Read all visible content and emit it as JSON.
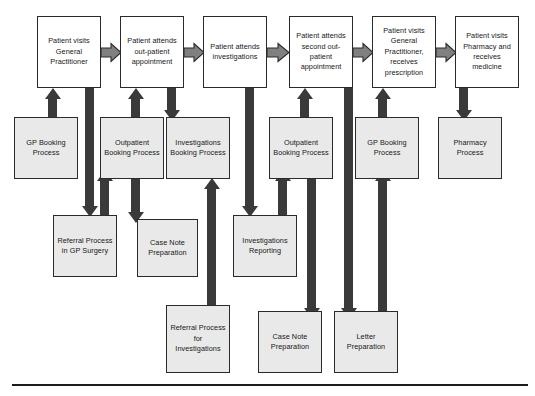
{
  "diagram": {
    "colors": {
      "patient_step_fill": "#ffffff",
      "process_fill": "#e9e9e9",
      "border": "#2b2b2b",
      "connector": "#3a3a3a",
      "chevron_fill": "#808080",
      "rule": "#1c1c1c"
    },
    "patient_steps": [
      {
        "id": "gp-visit",
        "label": "Patient visits General Practitioner"
      },
      {
        "id": "outpatient-1",
        "label": "Patient attends out-patient appointment"
      },
      {
        "id": "investigations",
        "label": "Patient attends investigations"
      },
      {
        "id": "outpatient-2",
        "label": "Patient attends second out-patient appointment"
      },
      {
        "id": "gp-prescription",
        "label": "Patient visits General Practitioner, receives prescription"
      },
      {
        "id": "pharmacy",
        "label": "Patient visits Pharmacy and receives medicine"
      }
    ],
    "support_processes_row2": [
      {
        "id": "gp-booking-1",
        "label": "GP Booking Process"
      },
      {
        "id": "outpatient-booking-1",
        "label": "Outpatient Booking Process"
      },
      {
        "id": "investigations-booking",
        "label": "Investigations Booking Process"
      },
      {
        "id": "outpatient-booking-2",
        "label": "Outpatient Booking Process"
      },
      {
        "id": "gp-booking-2",
        "label": "GP Booking Process"
      },
      {
        "id": "pharmacy-process",
        "label": "Pharmacy Process"
      }
    ],
    "support_processes_row3": [
      {
        "id": "referral-gp-surgery",
        "label": "Referral Process in GP Surgery"
      },
      {
        "id": "case-note-prep-1",
        "label": "Case Note Preparation"
      },
      {
        "id": "investigations-reporting",
        "label": "Investigations Reporting"
      }
    ],
    "support_processes_row4": [
      {
        "id": "referral-investigations",
        "label": "Referral Process for Investigations"
      },
      {
        "id": "case-note-prep-2",
        "label": "Case Note Preparation"
      },
      {
        "id": "letter-prep",
        "label": "Letter Preparation"
      }
    ],
    "chevron_count": 5
  }
}
